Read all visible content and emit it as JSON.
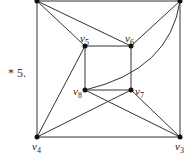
{
  "problem_label": "* 5.",
  "vertices": [
    {
      "id": "v1",
      "x": 37,
      "y": 0,
      "label": ""
    },
    {
      "id": "v2",
      "x": 180,
      "y": 0,
      "label": ""
    },
    {
      "id": "v3",
      "x": 180,
      "y": 137,
      "label": "v",
      "sub": "3"
    },
    {
      "id": "v4",
      "x": 37,
      "y": 137,
      "label": "v",
      "sub": "4"
    },
    {
      "id": "v5",
      "x": 85,
      "y": 46,
      "label": "v",
      "sub": "5"
    },
    {
      "id": "v6",
      "x": 131,
      "y": 46,
      "label": "v",
      "sub": "6"
    },
    {
      "id": "v7",
      "x": 131,
      "y": 90,
      "label": "v",
      "sub": "7"
    },
    {
      "id": "v8",
      "x": 85,
      "y": 90,
      "label": "v",
      "sub": "8"
    }
  ],
  "edges": [
    [
      "v1",
      "v2"
    ],
    [
      "v2",
      "v3"
    ],
    [
      "v3",
      "v4"
    ],
    [
      "v4",
      "v1"
    ],
    [
      "v5",
      "v6"
    ],
    [
      "v6",
      "v7"
    ],
    [
      "v7",
      "v8"
    ],
    [
      "v8",
      "v5"
    ],
    [
      "v1",
      "v5"
    ],
    [
      "v1",
      "v6"
    ],
    [
      "v2",
      "v6"
    ],
    [
      "v2",
      "v8"
    ],
    [
      "v4",
      "v5"
    ],
    [
      "v4",
      "v7"
    ],
    [
      "v3",
      "v7"
    ],
    [
      "v3",
      "v8"
    ]
  ],
  "colors": {
    "line": "#333333",
    "vertex": "#111111"
  }
}
